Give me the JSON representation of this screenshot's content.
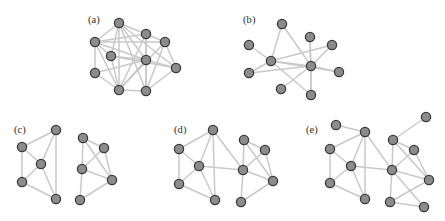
{
  "figure": {
    "width": 445,
    "height": 221,
    "background": "#ffffff",
    "node": {
      "radius": 4.6,
      "fill": "#8c8c8c",
      "stroke": "#3a3a3a",
      "stroke_width": 1.3
    },
    "edge": {
      "stroke": "#c9c9c9",
      "stroke_width": 1.5,
      "stroke_faint": "#dcdcdc"
    },
    "label_color": "#2c2c2c",
    "label_font_size": 10.5
  },
  "panels": [
    {
      "id": "panel-a",
      "label": "(a)",
      "caption": "single dense community of ten nodes",
      "label_pos": {
        "x": 88,
        "y": 14
      },
      "frame": {
        "x": 80,
        "y": 10,
        "width": 135,
        "height": 100
      },
      "nodes": [
        {
          "id": "a0",
          "x": 39,
          "y": 13
        },
        {
          "id": "a1",
          "x": 15,
          "y": 32
        },
        {
          "id": "a2",
          "x": 31,
          "y": 46
        },
        {
          "id": "a3",
          "x": 15,
          "y": 63
        },
        {
          "id": "a4",
          "x": 39,
          "y": 80
        },
        {
          "id": "a5",
          "x": 66,
          "y": 24
        },
        {
          "id": "a6",
          "x": 85,
          "y": 32
        },
        {
          "id": "a7",
          "x": 66,
          "y": 50
        },
        {
          "id": "a8",
          "x": 96,
          "y": 58
        },
        {
          "id": "a9",
          "x": 66,
          "y": 81
        }
      ],
      "edges": [
        [
          "a0",
          "a1"
        ],
        [
          "a0",
          "a2"
        ],
        [
          "a0",
          "a4"
        ],
        [
          "a0",
          "a5"
        ],
        [
          "a0",
          "a7"
        ],
        [
          "a0",
          "a8"
        ],
        [
          "a0",
          "a9"
        ],
        [
          "a1",
          "a2"
        ],
        [
          "a1",
          "a3"
        ],
        [
          "a1",
          "a4"
        ],
        [
          "a1",
          "a5"
        ],
        [
          "a1",
          "a6"
        ],
        [
          "a1",
          "a7"
        ],
        [
          "a2",
          "a4"
        ],
        [
          "a2",
          "a7"
        ],
        [
          "a2",
          "a8"
        ],
        [
          "a3",
          "a4"
        ],
        [
          "a3",
          "a7"
        ],
        [
          "a4",
          "a5"
        ],
        [
          "a4",
          "a6"
        ],
        [
          "a4",
          "a7"
        ],
        [
          "a4",
          "a9"
        ],
        [
          "a5",
          "a6"
        ],
        [
          "a5",
          "a7"
        ],
        [
          "a5",
          "a9"
        ],
        [
          "a6",
          "a8"
        ],
        [
          "a6",
          "a9"
        ],
        [
          "a7",
          "a8"
        ],
        [
          "a7",
          "a9"
        ],
        [
          "a8",
          "a9"
        ]
      ]
    },
    {
      "id": "panel-b",
      "label": "(b)",
      "caption": "sparse random graph of ten nodes",
      "label_pos": {
        "x": 243,
        "y": 14
      },
      "frame": {
        "x": 240,
        "y": 10,
        "width": 130,
        "height": 100
      },
      "nodes": [
        {
          "id": "b0",
          "x": 42,
          "y": 14
        },
        {
          "id": "b1",
          "x": 9,
          "y": 35
        },
        {
          "id": "b2",
          "x": 31,
          "y": 51
        },
        {
          "id": "b3",
          "x": 9,
          "y": 63
        },
        {
          "id": "b4",
          "x": 41,
          "y": 79
        },
        {
          "id": "b5",
          "x": 70,
          "y": 27
        },
        {
          "id": "b6",
          "x": 92,
          "y": 35
        },
        {
          "id": "b7",
          "x": 71,
          "y": 56
        },
        {
          "id": "b8",
          "x": 99,
          "y": 62
        },
        {
          "id": "b9",
          "x": 71,
          "y": 85
        }
      ],
      "edges": [
        [
          "b0",
          "b2"
        ],
        [
          "b0",
          "b7"
        ],
        [
          "b1",
          "b2"
        ],
        [
          "b2",
          "b3"
        ],
        [
          "b2",
          "b6"
        ],
        [
          "b2",
          "b7"
        ],
        [
          "b2",
          "b8"
        ],
        [
          "b2",
          "b9"
        ],
        [
          "b3",
          "b7"
        ],
        [
          "b4",
          "b7"
        ],
        [
          "b5",
          "b7"
        ],
        [
          "b5",
          "b9"
        ],
        [
          "b6",
          "b7"
        ],
        [
          "b7",
          "b8"
        ],
        [
          "b7",
          "b9"
        ]
      ]
    },
    {
      "id": "panel-c",
      "label": "(c)",
      "caption": "two disconnected communities of five nodes each",
      "label_pos": {
        "x": 14,
        "y": 124
      },
      "frame": {
        "x": 8,
        "y": 120,
        "width": 135,
        "height": 96
      },
      "nodes": [
        {
          "id": "c0",
          "x": 48,
          "y": 10
        },
        {
          "id": "c1",
          "x": 14,
          "y": 27
        },
        {
          "id": "c2",
          "x": 33,
          "y": 44
        },
        {
          "id": "c3",
          "x": 14,
          "y": 62
        },
        {
          "id": "c4",
          "x": 48,
          "y": 79
        },
        {
          "id": "c5",
          "x": 75,
          "y": 18
        },
        {
          "id": "c6",
          "x": 96,
          "y": 28
        },
        {
          "id": "c7",
          "x": 74,
          "y": 49
        },
        {
          "id": "c8",
          "x": 104,
          "y": 60
        },
        {
          "id": "c9",
          "x": 72,
          "y": 80
        }
      ],
      "edges": [
        [
          "c0",
          "c1"
        ],
        [
          "c0",
          "c2"
        ],
        [
          "c0",
          "c4"
        ],
        [
          "c1",
          "c2"
        ],
        [
          "c1",
          "c3"
        ],
        [
          "c2",
          "c3"
        ],
        [
          "c2",
          "c4"
        ],
        [
          "c3",
          "c4"
        ],
        [
          "c5",
          "c6"
        ],
        [
          "c5",
          "c7"
        ],
        [
          "c5",
          "c8"
        ],
        [
          "c6",
          "c7"
        ],
        [
          "c6",
          "c8"
        ],
        [
          "c7",
          "c8"
        ],
        [
          "c7",
          "c9"
        ],
        [
          "c8",
          "c9"
        ]
      ]
    },
    {
      "id": "panel-d",
      "label": "(d)",
      "caption": "two communities joined by a weak inter-community link",
      "label_pos": {
        "x": 174,
        "y": 124
      },
      "frame": {
        "x": 165,
        "y": 120,
        "width": 140,
        "height": 96
      },
      "nodes": [
        {
          "id": "d0",
          "x": 48,
          "y": 10
        },
        {
          "id": "d1",
          "x": 14,
          "y": 29
        },
        {
          "id": "d2",
          "x": 34,
          "y": 46
        },
        {
          "id": "d3",
          "x": 14,
          "y": 64
        },
        {
          "id": "d4",
          "x": 50,
          "y": 80
        },
        {
          "id": "d5",
          "x": 79,
          "y": 20
        },
        {
          "id": "d6",
          "x": 100,
          "y": 30
        },
        {
          "id": "d7",
          "x": 78,
          "y": 50
        },
        {
          "id": "d8",
          "x": 108,
          "y": 61
        },
        {
          "id": "d9",
          "x": 76,
          "y": 82
        }
      ],
      "edges": [
        [
          "d0",
          "d1"
        ],
        [
          "d0",
          "d2"
        ],
        [
          "d0",
          "d4"
        ],
        [
          "d0",
          "d7"
        ],
        [
          "d1",
          "d2"
        ],
        [
          "d1",
          "d3"
        ],
        [
          "d2",
          "d3"
        ],
        [
          "d2",
          "d4"
        ],
        [
          "d2",
          "d7"
        ],
        [
          "d3",
          "d4"
        ],
        [
          "d5",
          "d6"
        ],
        [
          "d5",
          "d7"
        ],
        [
          "d5",
          "d8"
        ],
        [
          "d6",
          "d7"
        ],
        [
          "d6",
          "d8"
        ],
        [
          "d7",
          "d8"
        ],
        [
          "d7",
          "d9"
        ],
        [
          "d8",
          "d9"
        ]
      ]
    },
    {
      "id": "panel-e",
      "label": "(e)",
      "caption": "two communities plus peripheral nodes and extra cross links",
      "label_pos": {
        "x": 306,
        "y": 124
      },
      "frame": {
        "x": 302,
        "y": 112,
        "width": 142,
        "height": 104
      },
      "nodes": [
        {
          "id": "e0",
          "x": 34,
          "y": 13
        },
        {
          "id": "e1",
          "x": 63,
          "y": 20
        },
        {
          "id": "e2",
          "x": 28,
          "y": 37
        },
        {
          "id": "e3",
          "x": 49,
          "y": 54
        },
        {
          "id": "e4",
          "x": 28,
          "y": 71
        },
        {
          "id": "e5",
          "x": 63,
          "y": 87
        },
        {
          "id": "e6",
          "x": 91,
          "y": 28
        },
        {
          "id": "e7",
          "x": 112,
          "y": 38
        },
        {
          "id": "e8",
          "x": 124,
          "y": 5
        },
        {
          "id": "e9",
          "x": 90,
          "y": 58
        },
        {
          "id": "e10",
          "x": 127,
          "y": 68
        },
        {
          "id": "e11",
          "x": 88,
          "y": 90
        },
        {
          "id": "e12",
          "x": 122,
          "y": 95
        }
      ],
      "edges": [
        [
          "e0",
          "e1"
        ],
        [
          "e1",
          "e2"
        ],
        [
          "e1",
          "e3"
        ],
        [
          "e1",
          "e5"
        ],
        [
          "e1",
          "e9"
        ],
        [
          "e2",
          "e3"
        ],
        [
          "e2",
          "e4"
        ],
        [
          "e3",
          "e4"
        ],
        [
          "e3",
          "e5"
        ],
        [
          "e3",
          "e9"
        ],
        [
          "e4",
          "e5"
        ],
        [
          "e6",
          "e7"
        ],
        [
          "e6",
          "e8"
        ],
        [
          "e6",
          "e9"
        ],
        [
          "e6",
          "e10"
        ],
        [
          "e7",
          "e9"
        ],
        [
          "e7",
          "e10"
        ],
        [
          "e9",
          "e10"
        ],
        [
          "e9",
          "e11"
        ],
        [
          "e9",
          "e12"
        ],
        [
          "e10",
          "e11"
        ],
        [
          "e11",
          "e12"
        ]
      ]
    }
  ]
}
